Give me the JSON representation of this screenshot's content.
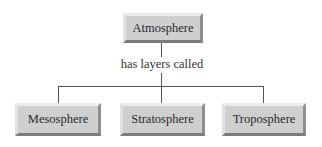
{
  "diagram": {
    "root": {
      "label": "Atmosphere"
    },
    "relation": {
      "label": "has layers called"
    },
    "children": [
      {
        "label": "Mesosphere"
      },
      {
        "label": "Stratosphere"
      },
      {
        "label": "Troposphere"
      }
    ]
  },
  "colors": {
    "box_fill": "#cfcfcf",
    "line": "#555555",
    "text": "#2a2a2a"
  }
}
